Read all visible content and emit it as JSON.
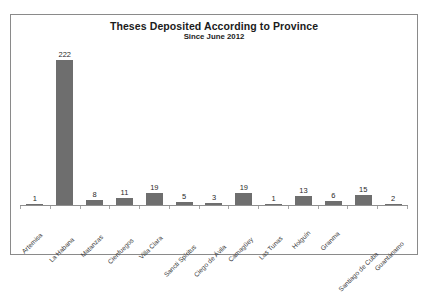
{
  "scan_artifact": "",
  "chart_data": {
    "type": "bar",
    "title": "Theses Deposited According to Province",
    "subtitle": "Since June 2012",
    "xlabel": "",
    "ylabel": "",
    "ylim": [
      0,
      240
    ],
    "grid": false,
    "legend": false,
    "orientation": "vertical",
    "bar_color": "#6e6e6e",
    "categories": [
      "Artemisa",
      "La Habana",
      "Matanzas",
      "Cienfuegos",
      "Villa Clara",
      "Sancti Spíritus",
      "Ciego de Ávila",
      "Camagüey",
      "Las Tunas",
      "Holguín",
      "Granma",
      "Santiago de Cuba",
      "Guantánamo"
    ],
    "values": [
      1,
      222,
      8,
      11,
      19,
      5,
      3,
      19,
      1,
      13,
      6,
      15,
      2
    ],
    "value_labels": [
      "1",
      "222",
      "8",
      "11",
      "19",
      "5",
      "3",
      "19",
      "1",
      "13",
      "6",
      "15",
      "2"
    ]
  }
}
